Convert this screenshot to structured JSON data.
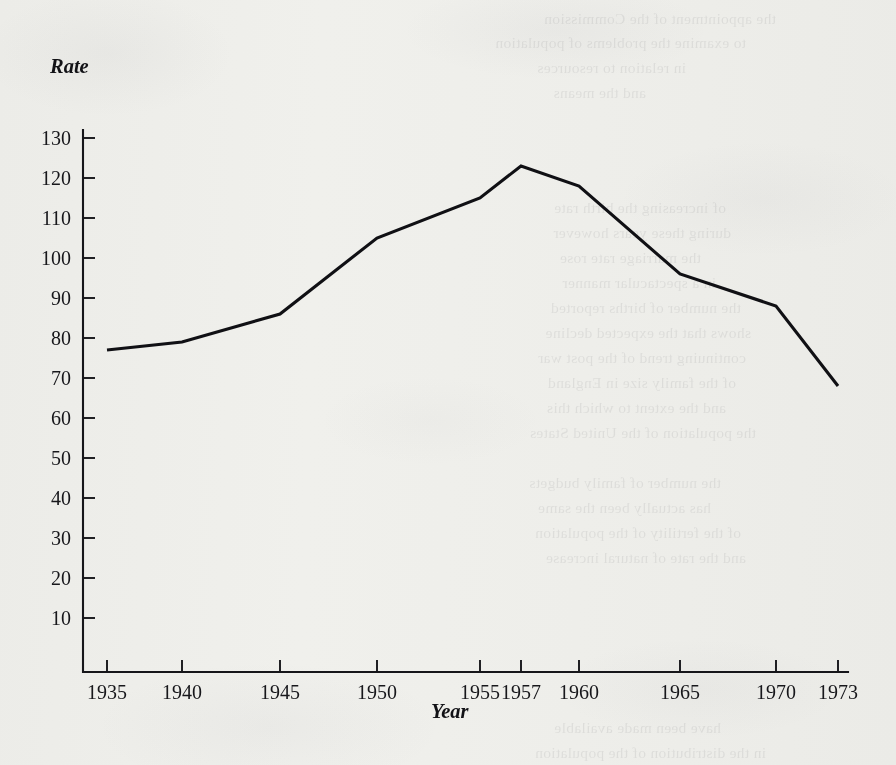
{
  "page": {
    "background_color": "#f7f7f5",
    "ink_color": "#16161a",
    "ghost_text_note": "faint illegible show-through text from reverse of scanned page"
  },
  "chart_data": {
    "type": "line",
    "title": "",
    "xlabel": "Year",
    "ylabel": "Rate",
    "x": [
      1935,
      1940,
      1945,
      1950,
      1955,
      1957,
      1960,
      1965,
      1970,
      1973
    ],
    "values": [
      77,
      79,
      86,
      105,
      115,
      123,
      118,
      96,
      88,
      68
    ],
    "series": [
      {
        "name": "Rate",
        "values": [
          77,
          79,
          86,
          105,
          115,
          123,
          118,
          96,
          88,
          68
        ]
      }
    ],
    "xlim": [
      1935,
      1973
    ],
    "ylim": [
      0,
      130
    ],
    "ytick_values": [
      130,
      120,
      110,
      100,
      90,
      80,
      70,
      60,
      50,
      40,
      30,
      20,
      10
    ],
    "ytick_labels": [
      "130",
      "120",
      "110",
      "100",
      "90",
      "80",
      "70",
      "60",
      "50",
      "40",
      "30",
      "20",
      "10"
    ],
    "xtick_values": [
      1935,
      1940,
      1945,
      1950,
      1955,
      1957,
      1960,
      1965,
      1970,
      1973
    ],
    "xtick_labels": [
      "1935",
      "1940",
      "1945",
      "1950",
      "1955",
      "1957",
      "1960",
      "1965",
      "1970",
      "1973"
    ],
    "grid": false,
    "legend": false,
    "legend_position": "none",
    "line_color": "#101014",
    "annotations": []
  },
  "labels": {
    "y_axis_title": "Rate",
    "x_axis_title": "Year"
  },
  "ghost_lines": [
    {
      "text": "the appointment of the Commission",
      "x": 120,
      "y": 6
    },
    {
      "text": "to examine the problems of population",
      "x": 150,
      "y": 30
    },
    {
      "text": "in relation to resources",
      "x": 210,
      "y": 55
    },
    {
      "text": "and the means",
      "x": 250,
      "y": 80
    },
    {
      "text": "of increasing the birth rate",
      "x": 170,
      "y": 195
    },
    {
      "text": "during these years however",
      "x": 165,
      "y": 220
    },
    {
      "text": "the marriage rate rose",
      "x": 195,
      "y": 245
    },
    {
      "text": "in a spectacular manner",
      "x": 180,
      "y": 270
    },
    {
      "text": "the number of births reported",
      "x": 155,
      "y": 295
    },
    {
      "text": "shows that the expected decline",
      "x": 145,
      "y": 320
    },
    {
      "text": "continuing trend of the post war",
      "x": 150,
      "y": 345
    },
    {
      "text": "of the family size in England",
      "x": 160,
      "y": 370
    },
    {
      "text": "and the extent to which this",
      "x": 170,
      "y": 395
    },
    {
      "text": "the population of the United States",
      "x": 140,
      "y": 420
    },
    {
      "text": "the number of family budgets",
      "x": 175,
      "y": 470
    },
    {
      "text": "has actually been the same",
      "x": 185,
      "y": 495
    },
    {
      "text": "of the fertility of the population",
      "x": 155,
      "y": 520
    },
    {
      "text": "and the rate of natural increase",
      "x": 150,
      "y": 545
    },
    {
      "text": "have been made available",
      "x": 175,
      "y": 715
    },
    {
      "text": "in the distribution of the population",
      "x": 130,
      "y": 740
    }
  ]
}
